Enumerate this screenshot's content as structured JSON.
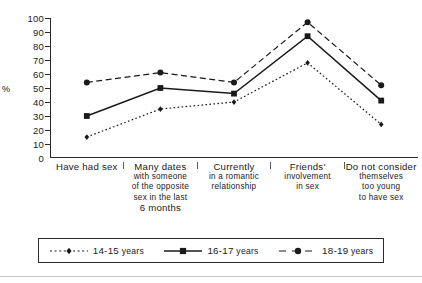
{
  "chart_data": {
    "type": "line",
    "title": "",
    "xlabel": "",
    "ylabel": "%",
    "ylim": [
      0,
      100
    ],
    "ytick_step": 10,
    "yticks": [
      "100",
      "90",
      "80",
      "70",
      "60",
      "50",
      "40",
      "30",
      "20",
      "10",
      "0"
    ],
    "grid": false,
    "legend_position": "bottom",
    "categories": [
      "Have had sex",
      "Many dates with someone of the opposite sex in the last 6 months",
      "Currently in a romantic relationship",
      "Friends' involvement in sex",
      "Do not consider themselves too young to have sex"
    ],
    "series": [
      {
        "name": "14-15 years",
        "marker": "diamond",
        "line": "dotted",
        "color": "#1a1a1a",
        "values": [
          15,
          35,
          40,
          68,
          24
        ]
      },
      {
        "name": "16-17 years",
        "marker": "square",
        "line": "solid",
        "color": "#1a1a1a",
        "values": [
          30,
          50,
          46,
          87,
          41
        ]
      },
      {
        "name": "18-19 years",
        "marker": "circle",
        "line": "dashed",
        "color": "#1a1a1a",
        "values": [
          54,
          61,
          54,
          97,
          52
        ]
      }
    ]
  },
  "axis": {
    "ylabel": "%",
    "ticks": [
      "100",
      "90",
      "80",
      "70",
      "60",
      "50",
      "40",
      "30",
      "20",
      "10",
      "0"
    ]
  },
  "categories": [
    {
      "lines": [
        {
          "t": "Have had sex",
          "cap": true
        }
      ]
    },
    {
      "lines": [
        {
          "t": "Many dates",
          "cap": true
        },
        {
          "t": "with someone",
          "cap": false
        },
        {
          "t": "of the opposite",
          "cap": false
        },
        {
          "t": "sex in the last",
          "cap": false
        },
        {
          "t": "6 months",
          "cap": true
        }
      ]
    },
    {
      "lines": [
        {
          "t": "Currently",
          "cap": true
        },
        {
          "t": "in a romantic",
          "cap": false
        },
        {
          "t": "relationship",
          "cap": false
        }
      ]
    },
    {
      "lines": [
        {
          "t": "Friends'",
          "cap": true
        },
        {
          "t": "involvement",
          "cap": false
        },
        {
          "t": "in sex",
          "cap": false
        }
      ]
    },
    {
      "lines": [
        {
          "t": "Do not consider",
          "cap": true
        },
        {
          "t": "themselves",
          "cap": false
        },
        {
          "t": "too young",
          "cap": false
        },
        {
          "t": "to have sex",
          "cap": false
        }
      ]
    }
  ],
  "legend": {
    "items": [
      {
        "num": "14-15",
        "unit": "years",
        "marker": "diamond",
        "line": "dotted"
      },
      {
        "num": "16-17",
        "unit": "years",
        "marker": "square",
        "line": "solid"
      },
      {
        "num": "18-19",
        "unit": "years",
        "marker": "circle",
        "line": "dashed"
      }
    ]
  }
}
